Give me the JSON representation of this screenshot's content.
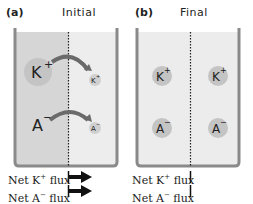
{
  "panels": [
    {
      "label": "(a)",
      "title": "Initial",
      "ions": {
        "k_left": {
          "symbol": "K",
          "charge": "+"
        },
        "k_right": {
          "symbol": "K",
          "charge": "+"
        },
        "a_left": {
          "symbol": "A",
          "charge": "−"
        },
        "a_right": {
          "symbol": "A",
          "charge": "−"
        }
      },
      "flux": [
        {
          "label_prefix": "Net K",
          "charge": "+",
          "label_suffix": " flux",
          "indicator": "arrow-right"
        },
        {
          "label_prefix": "Net A",
          "charge": "−",
          "label_suffix": " flux",
          "indicator": "arrow-right"
        }
      ]
    },
    {
      "label": "(b)",
      "title": "Final",
      "ions": {
        "k_left": {
          "symbol": "K",
          "charge": "+"
        },
        "k_right": {
          "symbol": "K",
          "charge": "+"
        },
        "a_left": {
          "symbol": "A",
          "charge": "−"
        },
        "a_right": {
          "symbol": "A",
          "charge": "−"
        }
      },
      "flux": [
        {
          "label_prefix": "Net K",
          "charge": "+",
          "label_suffix": " flux",
          "indicator": "zero-bar"
        },
        {
          "label_prefix": "Net A",
          "charge": "−",
          "label_suffix": " flux",
          "indicator": "zero-bar"
        }
      ]
    }
  ],
  "colors": {
    "wall": "#8a8a8a",
    "fluid_concentrated": "#d6d6d6",
    "fluid_dilute": "#ececec",
    "ion": "#c4c4c4",
    "arrow": "#6a6a6a"
  }
}
